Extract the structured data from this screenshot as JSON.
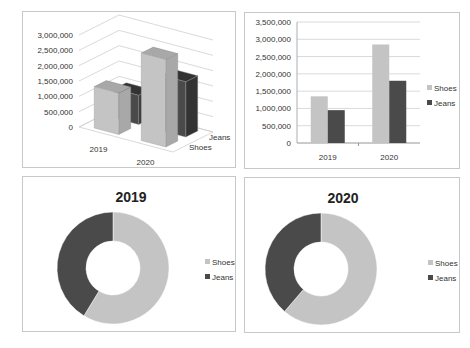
{
  "colors": {
    "shoes": "#c4c4c4",
    "jeans": "#4a4a4a",
    "shoes_side": "#a8a8a8",
    "jeans_side": "#333333",
    "grid": "#cfcfcf"
  },
  "chart_data": [
    {
      "id": "bar3d",
      "type": "bar",
      "style": "3d-column",
      "title": "",
      "categories": [
        "2019",
        "2020"
      ],
      "series": [
        {
          "name": "Shoes",
          "values": [
            1350000,
            2850000
          ]
        },
        {
          "name": "Jeans",
          "values": [
            950000,
            1800000
          ]
        }
      ],
      "depth_labels": [
        "Shoes",
        "Jeans"
      ],
      "ylim": [
        0,
        3000000
      ],
      "yticks": [
        "0",
        "500,000",
        "1,000,000",
        "1,500,000",
        "2,000,000",
        "2,500,000",
        "3,000,000"
      ],
      "grid": true,
      "legend": "none"
    },
    {
      "id": "bar2d",
      "type": "bar",
      "title": "",
      "categories": [
        "2019",
        "2020"
      ],
      "series": [
        {
          "name": "Shoes",
          "values": [
            1350000,
            2850000
          ]
        },
        {
          "name": "Jeans",
          "values": [
            950000,
            1800000
          ]
        }
      ],
      "ylim": [
        0,
        3500000
      ],
      "yticks": [
        "0",
        "500,000",
        "1,000,000",
        "1,500,000",
        "2,000,000",
        "2,500,000",
        "3,000,000",
        "3,500,000"
      ],
      "grid": true,
      "legend": "right"
    },
    {
      "id": "donut2019",
      "type": "pie",
      "style": "donut",
      "title": "2019",
      "labels": [
        "Shoes",
        "Jeans"
      ],
      "values": [
        1350000,
        950000
      ],
      "legend": "right"
    },
    {
      "id": "donut2020",
      "type": "pie",
      "style": "donut",
      "title": "2020",
      "labels": [
        "Shoes",
        "Jeans"
      ],
      "values": [
        2850000,
        1800000
      ],
      "legend": "right"
    }
  ]
}
